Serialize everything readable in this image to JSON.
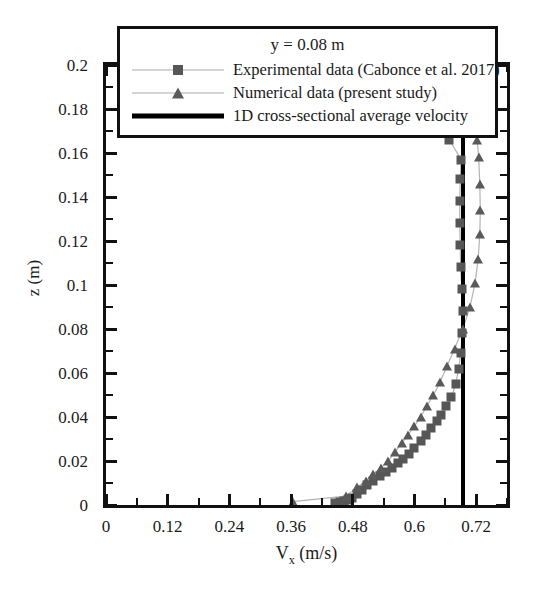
{
  "chart_data": {
    "type": "scatter",
    "title": "",
    "annotation": "y = 0.08 m",
    "xlabel": "V_x (m/s)",
    "xlabel_main": "V",
    "xlabel_sub": "x",
    "xlabel_units": " (m/s)",
    "ylabel": "z (m)",
    "xlim": [
      0,
      0.78
    ],
    "ylim": [
      0,
      0.2
    ],
    "x_major_step": 0.12,
    "x_minor_step": 0.06,
    "y_major_step": 0.02,
    "y_minor_step": 0.01,
    "grid": false,
    "legend_position": "top",
    "x_ticks": [
      "0",
      "0.12",
      "0.24",
      "0.36",
      "0.48",
      "0.6",
      "0.72"
    ],
    "x_tick_values": [
      0,
      0.12,
      0.24,
      0.36,
      0.48,
      0.6,
      0.72
    ],
    "y_ticks": [
      "0",
      "0.02",
      "0.04",
      "0.06",
      "0.08",
      "0.1",
      "0.12",
      "0.14",
      "0.16",
      "0.18",
      "0.2"
    ],
    "y_tick_values": [
      0,
      0.02,
      0.04,
      0.06,
      0.08,
      0.1,
      0.12,
      0.14,
      0.16,
      0.18,
      0.2
    ],
    "reference_line": {
      "name": "1D cross-sectional average velocity",
      "orientation": "vertical",
      "value": 0.695,
      "color": "#000000"
    },
    "series": [
      {
        "name": "Experimental data (Cabonce et al. 2017)",
        "marker": "square",
        "color": "#565656",
        "line": true,
        "points": [
          {
            "x": 0.445,
            "y": 0.001
          },
          {
            "x": 0.455,
            "y": 0.0015
          },
          {
            "x": 0.462,
            "y": 0.002
          },
          {
            "x": 0.47,
            "y": 0.0025
          },
          {
            "x": 0.478,
            "y": 0.003
          },
          {
            "x": 0.489,
            "y": 0.005
          },
          {
            "x": 0.498,
            "y": 0.007
          },
          {
            "x": 0.508,
            "y": 0.009
          },
          {
            "x": 0.52,
            "y": 0.011
          },
          {
            "x": 0.533,
            "y": 0.013
          },
          {
            "x": 0.545,
            "y": 0.015
          },
          {
            "x": 0.556,
            "y": 0.017
          },
          {
            "x": 0.568,
            "y": 0.019
          },
          {
            "x": 0.578,
            "y": 0.021
          },
          {
            "x": 0.59,
            "y": 0.023
          },
          {
            "x": 0.6,
            "y": 0.026
          },
          {
            "x": 0.612,
            "y": 0.029
          },
          {
            "x": 0.622,
            "y": 0.032
          },
          {
            "x": 0.632,
            "y": 0.035
          },
          {
            "x": 0.643,
            "y": 0.038
          },
          {
            "x": 0.652,
            "y": 0.041
          },
          {
            "x": 0.662,
            "y": 0.045
          },
          {
            "x": 0.672,
            "y": 0.049
          },
          {
            "x": 0.68,
            "y": 0.055
          },
          {
            "x": 0.686,
            "y": 0.062
          },
          {
            "x": 0.69,
            "y": 0.069
          },
          {
            "x": 0.693,
            "y": 0.078
          },
          {
            "x": 0.694,
            "y": 0.088
          },
          {
            "x": 0.692,
            "y": 0.098
          },
          {
            "x": 0.69,
            "y": 0.108
          },
          {
            "x": 0.689,
            "y": 0.118
          },
          {
            "x": 0.688,
            "y": 0.128
          },
          {
            "x": 0.688,
            "y": 0.138
          },
          {
            "x": 0.689,
            "y": 0.148
          },
          {
            "x": 0.691,
            "y": 0.157
          },
          {
            "x": 0.668,
            "y": 0.166
          }
        ]
      },
      {
        "name": "Numerical data (present study)",
        "marker": "triangle",
        "color": "#5a5a5a",
        "line": true,
        "points": [
          {
            "x": 0.363,
            "y": 0.0015
          },
          {
            "x": 0.466,
            "y": 0.004
          },
          {
            "x": 0.489,
            "y": 0.008
          },
          {
            "x": 0.505,
            "y": 0.011
          },
          {
            "x": 0.52,
            "y": 0.014
          },
          {
            "x": 0.535,
            "y": 0.017
          },
          {
            "x": 0.549,
            "y": 0.02
          },
          {
            "x": 0.562,
            "y": 0.024
          },
          {
            "x": 0.575,
            "y": 0.028
          },
          {
            "x": 0.588,
            "y": 0.032
          },
          {
            "x": 0.6,
            "y": 0.036
          },
          {
            "x": 0.612,
            "y": 0.04
          },
          {
            "x": 0.624,
            "y": 0.045
          },
          {
            "x": 0.637,
            "y": 0.05
          },
          {
            "x": 0.65,
            "y": 0.056
          },
          {
            "x": 0.663,
            "y": 0.063
          },
          {
            "x": 0.678,
            "y": 0.071
          },
          {
            "x": 0.694,
            "y": 0.08
          },
          {
            "x": 0.708,
            "y": 0.09
          },
          {
            "x": 0.718,
            "y": 0.101
          },
          {
            "x": 0.724,
            "y": 0.112
          },
          {
            "x": 0.727,
            "y": 0.123
          },
          {
            "x": 0.728,
            "y": 0.134
          },
          {
            "x": 0.727,
            "y": 0.146
          },
          {
            "x": 0.725,
            "y": 0.158
          },
          {
            "x": 0.722,
            "y": 0.166
          }
        ]
      }
    ]
  },
  "legend": {
    "title": "y = 0.08 m",
    "entries": [
      {
        "label": "Experimental data (Cabonce et al. 2017)",
        "key": "line-square"
      },
      {
        "label": "Numerical data (present study)",
        "key": "line-triangle"
      },
      {
        "label": "1D cross-sectional average velocity",
        "key": "thick-line"
      }
    ]
  }
}
